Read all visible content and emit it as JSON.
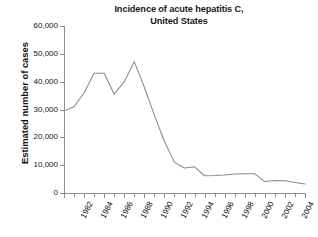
{
  "chart_data": {
    "type": "line",
    "title": "Incidence of acute hepatitis C, United States",
    "title_line1": "Incidence of acute hepatitis C,",
    "title_line2": "United States",
    "xlabel": "",
    "ylabel": "Estimated number of cases",
    "ylim": [
      0,
      60000
    ],
    "xlim": [
      1982,
      2006
    ],
    "grid": false,
    "legend": false,
    "y_ticks": [
      0,
      10000,
      20000,
      30000,
      40000,
      50000,
      60000
    ],
    "y_tick_labels": [
      "0",
      "10,000",
      "20,000",
      "30,000",
      "40,000",
      "50,000",
      "60,000"
    ],
    "x_ticks": [
      1982,
      1984,
      1986,
      1988,
      1990,
      1992,
      1994,
      1996,
      1998,
      2000,
      2002,
      2004,
      2006
    ],
    "x_tick_labels": [
      "1982",
      "1984",
      "1986",
      "1988",
      "1990",
      "1992",
      "1994",
      "1996",
      "1998",
      "2000",
      "2002",
      "2004",
      "2006"
    ],
    "x_minor_tick_interval": 1,
    "line_color": "#8a8a8a",
    "x": [
      1982,
      1983,
      1984,
      1985,
      1986,
      1987,
      1988,
      1989,
      1990,
      1991,
      1992,
      1993,
      1994,
      1995,
      1996,
      1997,
      1998,
      1999,
      2000,
      2001,
      2002,
      2003,
      2004,
      2005,
      2006
    ],
    "values": [
      29500,
      31000,
      36000,
      43000,
      43000,
      35500,
      40000,
      47200,
      38000,
      28000,
      18500,
      11000,
      9000,
      9400,
      6200,
      6300,
      6500,
      6800,
      6900,
      6900,
      4100,
      4500,
      4400,
      3800,
      3200
    ],
    "series": [
      {
        "name": "Estimated number of cases",
        "values": [
          29500,
          31000,
          36000,
          43000,
          43000,
          35500,
          40000,
          47200,
          38000,
          28000,
          18500,
          11000,
          9000,
          9400,
          6200,
          6300,
          6500,
          6800,
          6900,
          6900,
          4100,
          4500,
          4400,
          3800,
          3200
        ]
      }
    ]
  }
}
